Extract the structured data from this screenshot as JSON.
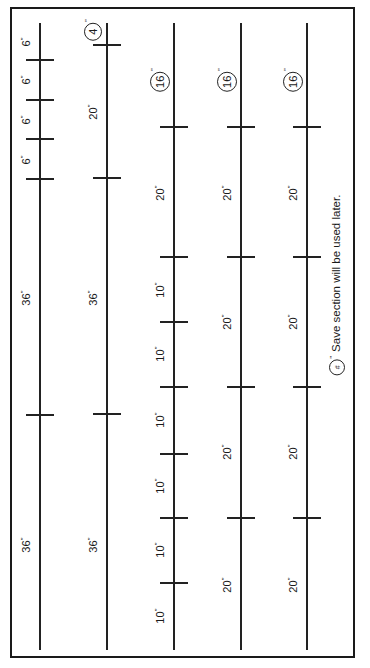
{
  "diagram": {
    "type": "cut-list / board layout (rotated 90°)",
    "orientation": "rotated-ccw",
    "unit_mark": "\"",
    "boards": [
      {
        "id": "board-1",
        "x": 40,
        "top": 23,
        "bottom": 650,
        "ticks": [
          60,
          100,
          139,
          179,
          415
        ],
        "labels": [
          {
            "text": "6",
            "y": 42,
            "circled": false
          },
          {
            "text": "6",
            "y": 80,
            "circled": false
          },
          {
            "text": "6",
            "y": 120,
            "circled": false
          },
          {
            "text": "6",
            "y": 160,
            "circled": false
          },
          {
            "text": "36",
            "y": 298,
            "circled": false
          },
          {
            "text": "36",
            "y": 545,
            "circled": false
          }
        ]
      },
      {
        "id": "board-2",
        "x": 107,
        "top": 23,
        "bottom": 650,
        "ticks": [
          45,
          178,
          414
        ],
        "labels": [
          {
            "text": "4",
            "y": 30,
            "circled": true
          },
          {
            "text": "20",
            "y": 112,
            "circled": false
          },
          {
            "text": "36",
            "y": 298,
            "circled": false
          },
          {
            "text": "36",
            "y": 545,
            "circled": false
          }
        ]
      },
      {
        "id": "board-3",
        "x": 174,
        "top": 23,
        "bottom": 650,
        "ticks": [
          127,
          257,
          322,
          387,
          454,
          518,
          583
        ],
        "labels": [
          {
            "text": "16",
            "y": 80,
            "circled": true
          },
          {
            "text": "20",
            "y": 193,
            "circled": false
          },
          {
            "text": "10",
            "y": 290,
            "circled": false
          },
          {
            "text": "10",
            "y": 354,
            "circled": false
          },
          {
            "text": "10",
            "y": 420,
            "circled": false
          },
          {
            "text": "10",
            "y": 486,
            "circled": false
          },
          {
            "text": "10",
            "y": 550,
            "circled": false
          },
          {
            "text": "10",
            "y": 616,
            "circled": false
          }
        ]
      },
      {
        "id": "board-4",
        "x": 241,
        "top": 23,
        "bottom": 650,
        "ticks": [
          127,
          257,
          387,
          518
        ],
        "labels": [
          {
            "text": "16",
            "y": 80,
            "circled": true
          },
          {
            "text": "20",
            "y": 193,
            "circled": false
          },
          {
            "text": "20",
            "y": 322,
            "circled": false
          },
          {
            "text": "20",
            "y": 452,
            "circled": false
          },
          {
            "text": "20",
            "y": 585,
            "circled": false
          }
        ]
      },
      {
        "id": "board-5",
        "x": 307,
        "top": 23,
        "bottom": 650,
        "ticks": [
          127,
          257,
          387,
          518
        ],
        "labels": [
          {
            "text": "16",
            "y": 80,
            "circled": true
          },
          {
            "text": "20",
            "y": 193,
            "circled": false
          },
          {
            "text": "20",
            "y": 322,
            "circled": false
          },
          {
            "text": "20",
            "y": 452,
            "circled": false
          },
          {
            "text": "20",
            "y": 585,
            "circled": false
          }
        ]
      }
    ],
    "legend": {
      "symbol": "#",
      "text": "Save section will be used later."
    },
    "colors": {
      "line": "#222222",
      "background": "#ffffff"
    }
  }
}
